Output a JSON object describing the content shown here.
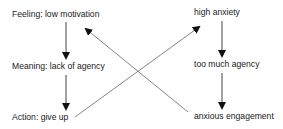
{
  "diagram": {
    "left_chain": [
      {
        "id": "feeling",
        "label": "Feeling: low motivation"
      },
      {
        "id": "meaning",
        "label": "Meaning: lack of agency"
      },
      {
        "id": "action",
        "label": "Action: give up"
      }
    ],
    "right_chain": [
      {
        "id": "high-anxiety",
        "label": "high anxiety"
      },
      {
        "id": "too-much-agency",
        "label": "too much agency"
      },
      {
        "id": "anxious-engagement",
        "label": "anxious engagement"
      }
    ],
    "edges": [
      {
        "from": "feeling",
        "to": "meaning"
      },
      {
        "from": "meaning",
        "to": "action"
      },
      {
        "from": "high-anxiety",
        "to": "too-much-agency"
      },
      {
        "from": "too-much-agency",
        "to": "anxious-engagement"
      },
      {
        "from": "action",
        "to": "high-anxiety"
      },
      {
        "from": "anxious-engagement",
        "to": "feeling"
      }
    ],
    "colors": {
      "text": "#1a1a1a",
      "line": "#555555",
      "arrowhead": "#111111"
    }
  }
}
